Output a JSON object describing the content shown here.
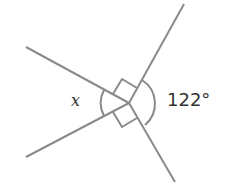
{
  "diagram": {
    "type": "angles at a point",
    "labels": {
      "unknown": "x",
      "known_angle": "122°"
    },
    "right_angle_markers": 2,
    "line_color": "#888888"
  }
}
